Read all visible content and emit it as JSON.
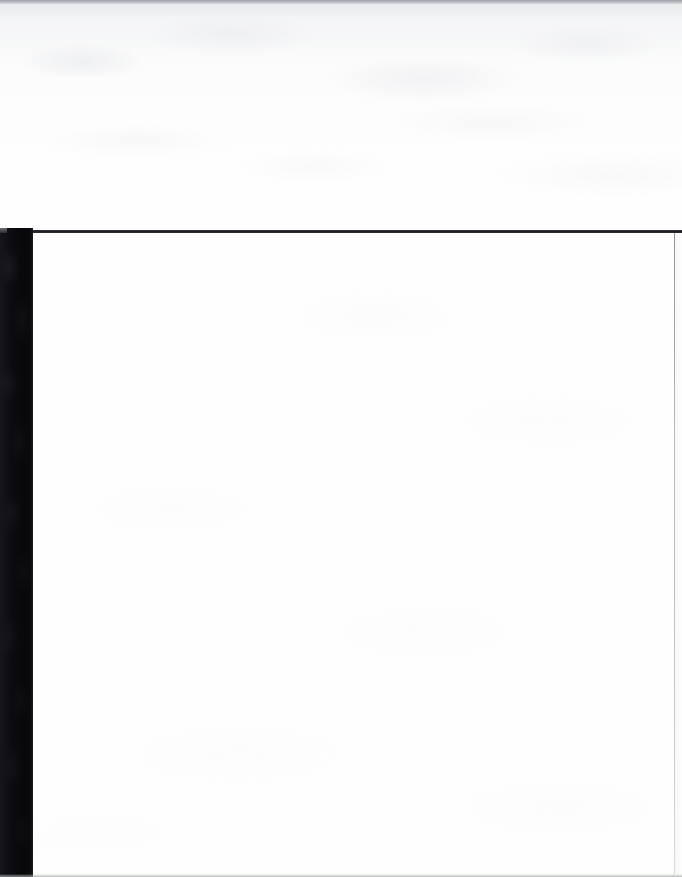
{
  "page": {
    "kind": "scanned-document-page",
    "width": 682,
    "height": 877,
    "content_text": "",
    "body_note": ""
  },
  "colors": {
    "paper": "#fefefe",
    "gutter_band": "#08080b",
    "header_rule": "#1b1b20",
    "right_rule": "#8a8c92",
    "top_edge": "#9fa1a6",
    "bottom_edge": "#96989e"
  },
  "regions": {
    "top_margin": {
      "label": ""
    },
    "gutter": {
      "label": ""
    },
    "header_rule": {
      "label": ""
    },
    "content": {
      "label": ""
    },
    "right_margin": {
      "label": ""
    },
    "bottom_margin": {
      "label": ""
    }
  }
}
